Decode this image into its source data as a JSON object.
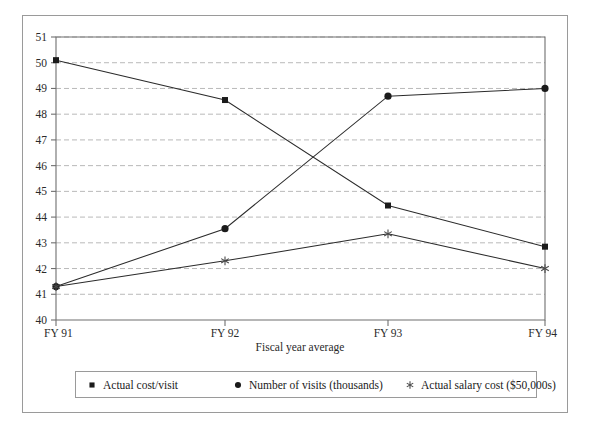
{
  "chart_data": {
    "type": "line",
    "title": "",
    "xlabel": "Fiscal year average",
    "ylabel": "",
    "categories": [
      "FY 91",
      "FY 92",
      "FY 93",
      "FY 94"
    ],
    "ylim": [
      40,
      51
    ],
    "yticks": [
      40,
      41,
      42,
      43,
      44,
      45,
      46,
      47,
      48,
      49,
      50,
      51
    ],
    "grid": true,
    "legend_position": "bottom",
    "series": [
      {
        "name": "Actual cost/visit",
        "marker": "square",
        "values": [
          50.1,
          48.55,
          44.45,
          42.85
        ]
      },
      {
        "name": "Number of visits (thousands)",
        "marker": "circle",
        "values": [
          41.3,
          43.55,
          48.7,
          49.0
        ]
      },
      {
        "name": "Actual salary cost ($50,000s)",
        "marker": "asterisk",
        "values": [
          41.3,
          42.3,
          43.35,
          42.0
        ]
      }
    ]
  },
  "axis": {
    "x_title": "Fiscal year average",
    "y_tick_labels": [
      "51",
      "50",
      "49",
      "48",
      "47",
      "46",
      "45",
      "44",
      "43",
      "42",
      "41",
      "40"
    ],
    "x_tick_labels": [
      "FY 91",
      "FY 92",
      "FY 93",
      "FY 94"
    ]
  },
  "legend": {
    "items": [
      {
        "label": "Actual cost/visit",
        "marker": "square-marker-icon"
      },
      {
        "label": "Number of visits (thousands)",
        "marker": "circle-marker-icon"
      },
      {
        "label": "Actual salary cost ($50,000s)",
        "marker": "asterisk-marker-icon"
      }
    ]
  },
  "colors": {
    "series_line": "#2b2b2b",
    "marker": "#1b1b1b",
    "gridline": "#b9b9b9",
    "axis": "#6f6f6f",
    "frame": "#9a9a9a",
    "background": "#ffffff"
  }
}
